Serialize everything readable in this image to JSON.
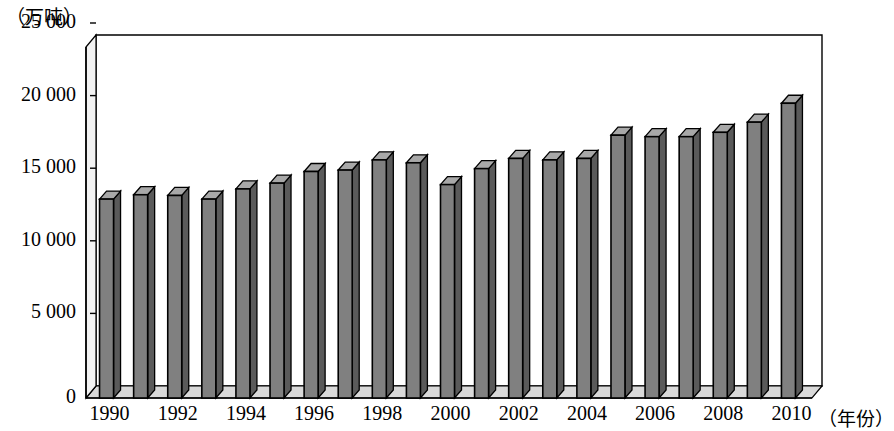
{
  "chart_data": {
    "type": "bar",
    "title": "",
    "subtitle": "",
    "ylabel": "（万吨）",
    "xlabel": "（年份）",
    "categories": [
      "1990",
      "1991",
      "1992",
      "1993",
      "1994",
      "1995",
      "1996",
      "1997",
      "1998",
      "1999",
      "2000",
      "2001",
      "2002",
      "2003",
      "2004",
      "2005",
      "2006",
      "2007",
      "2008",
      "2009",
      "2010"
    ],
    "values": [
      13700,
      14000,
      13950,
      13700,
      14400,
      14800,
      15600,
      15700,
      16400,
      16200,
      14700,
      15800,
      16500,
      16400,
      16500,
      18100,
      18000,
      18000,
      18300,
      19000,
      20300
    ],
    "ylim": [
      0,
      25000
    ],
    "yticks": [
      0,
      5000,
      10000,
      15000,
      20000,
      25000
    ],
    "ytick_labels": [
      "0",
      "5 000",
      "10 000",
      "15 000",
      "20 000",
      "25 000"
    ],
    "xtick_labels": [
      "1990",
      "1992",
      "1994",
      "1996",
      "1998",
      "2000",
      "2002",
      "2004",
      "2006",
      "2008",
      "2010"
    ],
    "grid": false,
    "legend": null,
    "bar_color": "#808080",
    "bar_edge_color": "#000000",
    "bar_side_color": "#5a5a5a",
    "bar_top_color": "#a8a8a8",
    "axis_color": "#000000",
    "background": "#ffffff",
    "style": "3d-column"
  },
  "axis": {
    "unit_y": "（万吨）",
    "unit_x": "（年份）"
  }
}
